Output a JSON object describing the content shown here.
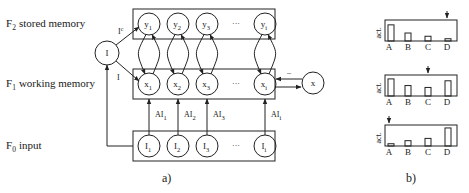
{
  "panel_a": {
    "caption": "a)",
    "layers": [
      {
        "id": "F2",
        "sub": "2",
        "label": "stored memory",
        "nodes": [
          "y1",
          "y2",
          "y3",
          "…",
          "yi"
        ]
      },
      {
        "id": "F1",
        "sub": "1",
        "label": "working memory",
        "nodes": [
          "x1",
          "x2",
          "x3",
          "…",
          "xi"
        ]
      },
      {
        "id": "F0",
        "sub": "0",
        "label": "input",
        "nodes": [
          "I1",
          "I2",
          "I3",
          "…",
          "Ii"
        ]
      }
    ],
    "layer_prefix": "F",
    "node_labels": {
      "F2": [
        {
          "base": "y",
          "sub": "1"
        },
        {
          "base": "y",
          "sub": "2"
        },
        {
          "base": "y",
          "sub": "3"
        },
        {
          "base": "…",
          "sub": ""
        },
        {
          "base": "y",
          "sub": "i"
        }
      ],
      "F1": [
        {
          "base": "x",
          "sub": "1"
        },
        {
          "base": "x",
          "sub": "2"
        },
        {
          "base": "x",
          "sub": "3"
        },
        {
          "base": "…",
          "sub": ""
        },
        {
          "base": "x",
          "sub": "i"
        }
      ],
      "F0": [
        {
          "base": "I",
          "sub": "1"
        },
        {
          "base": "I",
          "sub": "2"
        },
        {
          "base": "I",
          "sub": "3"
        },
        {
          "base": "…",
          "sub": ""
        },
        {
          "base": "I",
          "sub": "i"
        }
      ]
    },
    "input_edges": [
      {
        "base": "AI",
        "sub": "1"
      },
      {
        "base": "AI",
        "sub": "2"
      },
      {
        "base": "AI",
        "sub": "3"
      },
      {
        "base": "AI",
        "sub": "i"
      }
    ],
    "I_node": "I",
    "I_to_F2_label": {
      "base": "I",
      "sup": "c"
    },
    "I_to_F1_label": "I",
    "x_node": "x",
    "x_feedback_label": "–"
  },
  "panel_b": {
    "caption": "b)",
    "y_label": "act.",
    "categories": [
      "A",
      "B",
      "C",
      "D"
    ]
  },
  "chart_data": [
    {
      "type": "bar",
      "title": "",
      "xlabel": "",
      "ylabel": "act.",
      "categories": [
        "A",
        "B",
        "C",
        "D"
      ],
      "values": [
        0.85,
        0.42,
        0.25,
        0.12
      ],
      "ylim": [
        0,
        1
      ],
      "annotation": {
        "arrow_at": "D"
      }
    },
    {
      "type": "bar",
      "title": "",
      "xlabel": "",
      "ylabel": "act.",
      "categories": [
        "A",
        "B",
        "C",
        "D"
      ],
      "values": [
        0.9,
        0.55,
        0.45,
        0.8
      ],
      "ylim": [
        0,
        1
      ],
      "annotation": {
        "arrow_at": "C"
      }
    },
    {
      "type": "bar",
      "title": "",
      "xlabel": "",
      "ylabel": "act.",
      "categories": [
        "A",
        "B",
        "C",
        "D"
      ],
      "values": [
        0.12,
        0.28,
        0.4,
        0.95
      ],
      "ylim": [
        0,
        1
      ],
      "annotation": {
        "arrow_at": "A"
      }
    }
  ]
}
